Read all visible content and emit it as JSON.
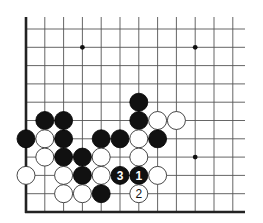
{
  "diagram": {
    "type": "go-board-fragment",
    "grid": {
      "columns": 12,
      "rows": 11,
      "origin_x": 26,
      "origin_y": 212,
      "spacing_x": 18.8,
      "spacing_y": 18.3,
      "line_extent_right": 245,
      "line_extent_top": 17,
      "edges": [
        "left",
        "bottom"
      ]
    },
    "star_points": [
      {
        "col": 3,
        "row": 9
      },
      {
        "col": 9,
        "row": 9
      },
      {
        "col": 9,
        "row": 3
      }
    ],
    "stones": [
      {
        "col": 6,
        "row": 6,
        "color": "black",
        "label": ""
      },
      {
        "col": 1,
        "row": 5,
        "color": "black",
        "label": ""
      },
      {
        "col": 2,
        "row": 5,
        "color": "black",
        "label": ""
      },
      {
        "col": 6,
        "row": 5,
        "color": "black",
        "label": ""
      },
      {
        "col": 7,
        "row": 5,
        "color": "white",
        "label": ""
      },
      {
        "col": 8,
        "row": 5,
        "color": "white",
        "label": ""
      },
      {
        "col": 0,
        "row": 4,
        "color": "black",
        "label": ""
      },
      {
        "col": 1,
        "row": 4,
        "color": "white",
        "label": ""
      },
      {
        "col": 2,
        "row": 4,
        "color": "black",
        "label": ""
      },
      {
        "col": 4,
        "row": 4,
        "color": "black",
        "label": ""
      },
      {
        "col": 5,
        "row": 4,
        "color": "black",
        "label": ""
      },
      {
        "col": 6,
        "row": 4,
        "color": "white",
        "label": ""
      },
      {
        "col": 7,
        "row": 4,
        "color": "black",
        "label": ""
      },
      {
        "col": 1,
        "row": 3,
        "color": "white",
        "label": ""
      },
      {
        "col": 2,
        "row": 3,
        "color": "black",
        "label": ""
      },
      {
        "col": 3,
        "row": 3,
        "color": "black",
        "label": ""
      },
      {
        "col": 4,
        "row": 3,
        "color": "white",
        "label": ""
      },
      {
        "col": 6,
        "row": 3,
        "color": "white",
        "label": ""
      },
      {
        "col": 0,
        "row": 2,
        "color": "white",
        "label": ""
      },
      {
        "col": 2,
        "row": 2,
        "color": "white",
        "label": ""
      },
      {
        "col": 3,
        "row": 2,
        "color": "black",
        "label": ""
      },
      {
        "col": 4,
        "row": 2,
        "color": "white",
        "label": ""
      },
      {
        "col": 5,
        "row": 2,
        "color": "black",
        "label": "3"
      },
      {
        "col": 6,
        "row": 2,
        "color": "black",
        "label": "1"
      },
      {
        "col": 7,
        "row": 2,
        "color": "white",
        "label": ""
      },
      {
        "col": 2,
        "row": 1,
        "color": "white",
        "label": ""
      },
      {
        "col": 3,
        "row": 1,
        "color": "white",
        "label": ""
      },
      {
        "col": 4,
        "row": 1,
        "color": "black",
        "label": ""
      },
      {
        "col": 6,
        "row": 1,
        "color": "white",
        "label": "2"
      }
    ],
    "move_sequence": [
      {
        "move": 1,
        "color": "black",
        "col": 6,
        "row": 2
      },
      {
        "move": 2,
        "color": "white",
        "col": 6,
        "row": 1
      },
      {
        "move": 3,
        "color": "black",
        "col": 5,
        "row": 2
      }
    ],
    "colors": {
      "background": "#ffffff",
      "black_stone": "#111111",
      "white_stone": "#ffffff",
      "grid": "#555555"
    },
    "stone_radius": 9
  }
}
